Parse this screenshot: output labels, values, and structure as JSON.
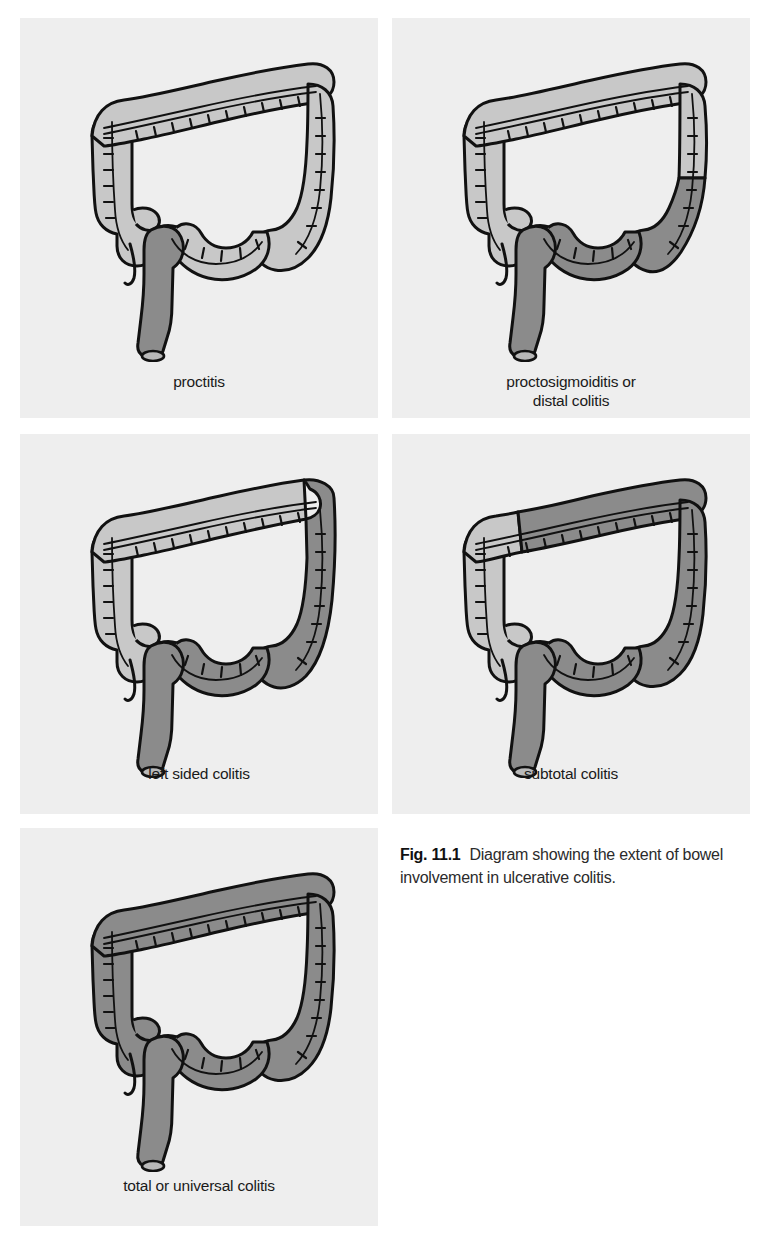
{
  "figure": {
    "number": "Fig. 11.1",
    "caption_text": "Diagram showing the extent of bowel involvement in ulcerative colitis.",
    "colors": {
      "panel_background": "#eeeeee",
      "page_background": "#ffffff",
      "uninvolved_bowel": "#c8c8c8",
      "involved_bowel": "#8b8b8b",
      "outline": "#111111",
      "label_text": "#1a1a1a",
      "caption_text": "#2b2b2b"
    }
  },
  "panels": [
    {
      "id": "proctitis",
      "label": "proctitis",
      "label_lines": [
        "proctitis"
      ],
      "involvement": "rectum only",
      "involved_segments": [
        "rectum"
      ],
      "uninvolved_segments": [
        "cecum",
        "appendix",
        "ascending colon",
        "hepatic flexure",
        "transverse colon",
        "splenic flexure",
        "descending colon",
        "sigmoid colon"
      ]
    },
    {
      "id": "proctosigmoiditis",
      "label": "proctosigmoiditis or distal colitis",
      "label_lines": [
        "proctosigmoiditis or",
        "distal colitis"
      ],
      "involvement": "rectum and sigmoid colon",
      "involved_segments": [
        "rectum",
        "sigmoid colon",
        "lower descending colon"
      ],
      "uninvolved_segments": [
        "cecum",
        "appendix",
        "ascending colon",
        "hepatic flexure",
        "transverse colon",
        "splenic flexure",
        "upper descending colon"
      ]
    },
    {
      "id": "left-sided-colitis",
      "label": "left sided colitis",
      "label_lines": [
        "left sided colitis"
      ],
      "involvement": "rectum to splenic flexure",
      "involved_segments": [
        "rectum",
        "sigmoid colon",
        "descending colon",
        "splenic flexure"
      ],
      "uninvolved_segments": [
        "cecum",
        "appendix",
        "ascending colon",
        "hepatic flexure",
        "transverse colon"
      ]
    },
    {
      "id": "subtotal-colitis",
      "label": "subtotal colitis",
      "label_lines": [
        "subtotal colitis"
      ],
      "involvement": "rectum to transverse colon",
      "involved_segments": [
        "rectum",
        "sigmoid colon",
        "descending colon",
        "splenic flexure",
        "transverse colon",
        "hepatic flexure"
      ],
      "uninvolved_segments": [
        "cecum",
        "appendix",
        "ascending colon"
      ]
    },
    {
      "id": "total-colitis",
      "label": "total or universal colitis",
      "label_lines": [
        "total or universal colitis"
      ],
      "involvement": "entire colon and rectum",
      "involved_segments": [
        "rectum",
        "sigmoid colon",
        "descending colon",
        "splenic flexure",
        "transverse colon",
        "hepatic flexure",
        "ascending colon",
        "cecum"
      ],
      "uninvolved_segments": []
    }
  ]
}
